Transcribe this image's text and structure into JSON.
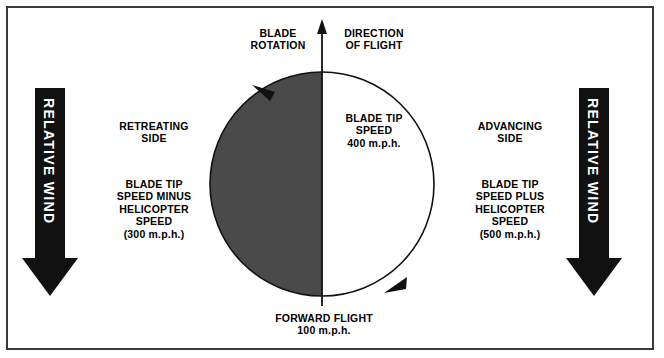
{
  "diagram": {
    "title_top_left": "BLADE\nROTATION",
    "title_top_right": "DIRECTION\nOF FLIGHT",
    "left_side_label": "RETREATING\nSIDE",
    "left_side_detail": "BLADE TIP\nSPEED MINUS\nHELICOPTER\nSPEED\n(300 m.p.h.)",
    "right_side_label": "ADVANCING\nSIDE",
    "right_side_detail": "BLADE TIP\nSPEED PLUS\nHELICOPTER\nSPEED\n(500 m.p.h.)",
    "center_label": "BLADE TIP\nSPEED\n400 m.p.h.",
    "bottom_label": "FORWARD FLIGHT\n100 m.p.h.",
    "wind_left_label": "RELATIVE WIND",
    "wind_right_label": "RELATIVE WIND",
    "values": {
      "blade_tip_speed": "400 m.p.h.",
      "forward_flight_speed": "100 m.p.h.",
      "retreating_side_speed": "(300 m.p.h.)",
      "advancing_side_speed": "(500 m.p.h.)"
    },
    "colors": {
      "retreating_half": "#4a4a4a",
      "advancing_half": "#ffffff",
      "outline": "#111111",
      "border": "#3a3a3a",
      "arrow_fill": "#111111",
      "wind_text": "#ffffff"
    },
    "rotation_direction": "counterclockwise"
  }
}
